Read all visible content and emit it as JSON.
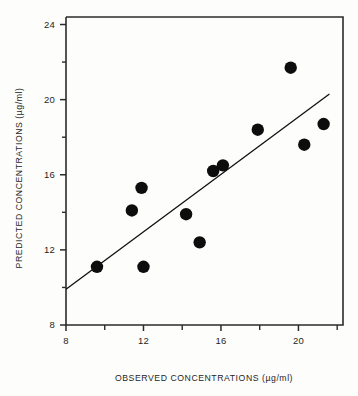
{
  "chart_data": {
    "type": "scatter",
    "title": "",
    "xlabel": "OBSERVED CONCENTRATIONS (µg/ml)",
    "ylabel": "PREDICTED CONCENTRATIONS (µg/ml)",
    "xlim": [
      8,
      22.3
    ],
    "ylim": [
      8,
      24.4
    ],
    "grid": false,
    "legend": null,
    "x_ticks_major": [
      8,
      12,
      16,
      20
    ],
    "x_tick_labels": [
      "8",
      "12",
      "16",
      "20"
    ],
    "x_ticks_minor": [
      10,
      14,
      18,
      22
    ],
    "y_ticks_major": [
      8,
      12,
      16,
      20,
      24
    ],
    "y_tick_labels": [
      "8",
      "12",
      "16",
      "20",
      "24"
    ],
    "y_ticks_minor": [
      10,
      14,
      18,
      22
    ],
    "marker": "filled-circle",
    "marker_color": "#0d0d0d",
    "marker_radius_px": 6.2,
    "points": [
      {
        "x": 9.6,
        "y": 11.1
      },
      {
        "x": 11.4,
        "y": 14.1
      },
      {
        "x": 11.9,
        "y": 15.3
      },
      {
        "x": 12.0,
        "y": 11.1
      },
      {
        "x": 14.2,
        "y": 13.9
      },
      {
        "x": 14.9,
        "y": 12.4
      },
      {
        "x": 15.6,
        "y": 16.2
      },
      {
        "x": 16.1,
        "y": 16.5
      },
      {
        "x": 17.9,
        "y": 18.4
      },
      {
        "x": 19.6,
        "y": 21.7
      },
      {
        "x": 20.3,
        "y": 17.6
      },
      {
        "x": 21.3,
        "y": 18.7
      }
    ],
    "fit_line": {
      "name": "regression line",
      "x_start": 8.0,
      "y_start": 9.9,
      "x_end": 21.6,
      "y_end": 20.3,
      "color": "#111111"
    }
  },
  "colors": {
    "axis": "#2b2b2b",
    "marker": "#0d0d0d",
    "line": "#111111",
    "background": "#fdfdfc",
    "text": "#1f1f1f"
  }
}
